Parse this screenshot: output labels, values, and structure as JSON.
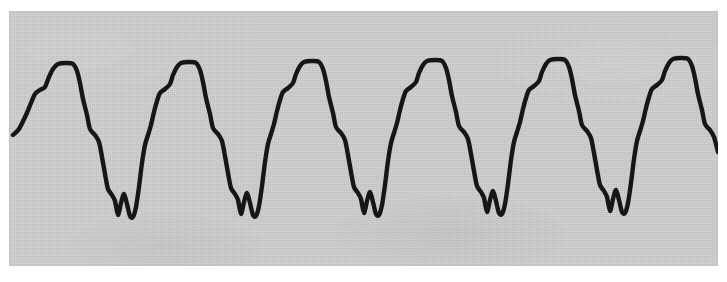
{
  "figure": {
    "title": "",
    "caption": "",
    "panel": {
      "background_color": "#cfcfcf",
      "x": 9,
      "y": 11,
      "width": 709,
      "height": 255
    },
    "trace": {
      "stroke_color": "#161616",
      "stroke_width": 4.4
    }
  },
  "chart_data": {
    "type": "line",
    "title": "",
    "subtitle": "",
    "xlabel": "",
    "ylabel": "",
    "grid": false,
    "legend": null,
    "annotations": [],
    "axes": {
      "x_ticks": [],
      "y_ticks": [],
      "xlim": [
        0,
        709
      ],
      "ylim": [
        0,
        255
      ],
      "y_inverted": true
    },
    "period_px": 112,
    "peak_count": 7,
    "notch_count": 6,
    "peak_plateau_centers_x": [
      43,
      152,
      262,
      368,
      477,
      588,
      680
    ],
    "notch_centers_x": [
      96,
      216,
      331,
      444,
      561,
      674
    ],
    "peak_plateau_y": 53,
    "notch_bottom_y": 205,
    "series": [
      {
        "name": "waveform",
        "points": [
          [
            4,
            124
          ],
          [
            10,
            118
          ],
          [
            17,
            104
          ],
          [
            22,
            92
          ],
          [
            26,
            83
          ],
          [
            31,
            79
          ],
          [
            36,
            76
          ],
          [
            40,
            66
          ],
          [
            44,
            58
          ],
          [
            49,
            53
          ],
          [
            57,
            52
          ],
          [
            64,
            53
          ],
          [
            68,
            60
          ],
          [
            71,
            72
          ],
          [
            74,
            88
          ],
          [
            78,
            104
          ],
          [
            81,
            118
          ],
          [
            86,
            124
          ],
          [
            90,
            131
          ],
          [
            93,
            146
          ],
          [
            96,
            163
          ],
          [
            99,
            178
          ],
          [
            103,
            184
          ],
          [
            106,
            190
          ],
          [
            109,
            204
          ],
          [
            112,
            192
          ],
          [
            115,
            183
          ],
          [
            118,
            193
          ],
          [
            121,
            205
          ],
          [
            124,
            206
          ],
          [
            127,
            196
          ],
          [
            130,
            176
          ],
          [
            133,
            152
          ],
          [
            136,
            134
          ],
          [
            139,
            124
          ],
          [
            142,
            114
          ],
          [
            145,
            101
          ],
          [
            148,
            90
          ],
          [
            151,
            82
          ],
          [
            156,
            78
          ],
          [
            161,
            73
          ],
          [
            164,
            64
          ],
          [
            168,
            56
          ],
          [
            172,
            52
          ],
          [
            180,
            51
          ],
          [
            187,
            52
          ],
          [
            191,
            59
          ],
          [
            194,
            71
          ],
          [
            197,
            87
          ],
          [
            201,
            103
          ],
          [
            204,
            117
          ],
          [
            209,
            123
          ],
          [
            213,
            130
          ],
          [
            216,
            145
          ],
          [
            219,
            162
          ],
          [
            222,
            177
          ],
          [
            226,
            183
          ],
          [
            229,
            189
          ],
          [
            232,
            203
          ],
          [
            235,
            191
          ],
          [
            238,
            182
          ],
          [
            241,
            192
          ],
          [
            244,
            204
          ],
          [
            247,
            205
          ],
          [
            250,
            195
          ],
          [
            253,
            175
          ],
          [
            256,
            151
          ],
          [
            259,
            133
          ],
          [
            262,
            123
          ],
          [
            265,
            113
          ],
          [
            268,
            100
          ],
          [
            271,
            89
          ],
          [
            274,
            81
          ],
          [
            279,
            77
          ],
          [
            284,
            72
          ],
          [
            287,
            63
          ],
          [
            291,
            55
          ],
          [
            295,
            51
          ],
          [
            303,
            50
          ],
          [
            310,
            51
          ],
          [
            314,
            58
          ],
          [
            317,
            70
          ],
          [
            320,
            86
          ],
          [
            324,
            102
          ],
          [
            327,
            116
          ],
          [
            332,
            122
          ],
          [
            336,
            129
          ],
          [
            339,
            144
          ],
          [
            342,
            161
          ],
          [
            345,
            176
          ],
          [
            349,
            182
          ],
          [
            352,
            188
          ],
          [
            355,
            202
          ],
          [
            358,
            190
          ],
          [
            361,
            181
          ],
          [
            364,
            191
          ],
          [
            367,
            203
          ],
          [
            370,
            204
          ],
          [
            373,
            194
          ],
          [
            376,
            174
          ],
          [
            379,
            150
          ],
          [
            382,
            132
          ],
          [
            385,
            122
          ],
          [
            388,
            112
          ],
          [
            391,
            99
          ],
          [
            394,
            88
          ],
          [
            397,
            80
          ],
          [
            402,
            76
          ],
          [
            407,
            71
          ],
          [
            410,
            62
          ],
          [
            414,
            54
          ],
          [
            418,
            50
          ],
          [
            426,
            49
          ],
          [
            433,
            50
          ],
          [
            437,
            57
          ],
          [
            440,
            69
          ],
          [
            443,
            85
          ],
          [
            447,
            101
          ],
          [
            450,
            115
          ],
          [
            455,
            121
          ],
          [
            459,
            128
          ],
          [
            462,
            143
          ],
          [
            465,
            160
          ],
          [
            468,
            175
          ],
          [
            472,
            181
          ],
          [
            475,
            187
          ],
          [
            478,
            201
          ],
          [
            481,
            189
          ],
          [
            484,
            180
          ],
          [
            487,
            190
          ],
          [
            490,
            202
          ],
          [
            493,
            203
          ],
          [
            496,
            193
          ],
          [
            499,
            173
          ],
          [
            502,
            149
          ],
          [
            505,
            131
          ],
          [
            508,
            121
          ],
          [
            511,
            111
          ],
          [
            514,
            98
          ],
          [
            517,
            87
          ],
          [
            520,
            79
          ],
          [
            525,
            75
          ],
          [
            530,
            70
          ],
          [
            533,
            61
          ],
          [
            537,
            53
          ],
          [
            541,
            49
          ],
          [
            549,
            48
          ],
          [
            556,
            49
          ],
          [
            560,
            56
          ],
          [
            563,
            68
          ],
          [
            566,
            84
          ],
          [
            570,
            100
          ],
          [
            573,
            114
          ],
          [
            578,
            120
          ],
          [
            582,
            127
          ],
          [
            585,
            142
          ],
          [
            588,
            159
          ],
          [
            591,
            174
          ],
          [
            595,
            180
          ],
          [
            598,
            186
          ],
          [
            601,
            200
          ],
          [
            604,
            188
          ],
          [
            607,
            179
          ],
          [
            610,
            189
          ],
          [
            613,
            201
          ],
          [
            616,
            202
          ],
          [
            619,
            192
          ],
          [
            622,
            172
          ],
          [
            625,
            148
          ],
          [
            628,
            130
          ],
          [
            631,
            120
          ],
          [
            634,
            110
          ],
          [
            637,
            97
          ],
          [
            640,
            86
          ],
          [
            643,
            78
          ],
          [
            648,
            74
          ],
          [
            653,
            69
          ],
          [
            656,
            60
          ],
          [
            660,
            52
          ],
          [
            664,
            48
          ],
          [
            672,
            47
          ],
          [
            679,
            48
          ],
          [
            683,
            55
          ],
          [
            686,
            67
          ],
          [
            689,
            83
          ],
          [
            693,
            99
          ],
          [
            696,
            113
          ],
          [
            701,
            119
          ],
          [
            705,
            126
          ],
          [
            709,
            141
          ]
        ]
      }
    ]
  }
}
